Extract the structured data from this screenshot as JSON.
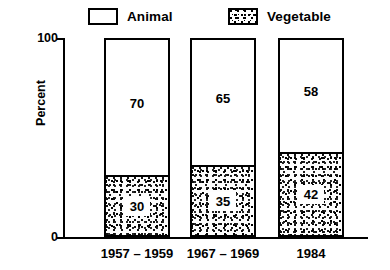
{
  "chart_data": {
    "type": "bar",
    "subtype": "stacked-bar",
    "title": "",
    "xlabel": "",
    "ylabel": "Percent",
    "ylim": [
      0,
      100
    ],
    "ytick_labels": [
      "0",
      "100"
    ],
    "grid": false,
    "legend_position": "top",
    "categories": [
      "1957 – 1959",
      "1967 – 1969",
      "1984"
    ],
    "series": [
      {
        "name": "Animal",
        "values": [
          70,
          65,
          58
        ],
        "fill": "white",
        "swatch": "empty-box"
      },
      {
        "name": "Vegetable",
        "values": [
          30,
          35,
          42
        ],
        "fill": "stipple",
        "swatch": "stippled-box"
      }
    ],
    "bars": [
      {
        "category": "1957 – 1959",
        "segments": [
          {
            "series": "Animal",
            "value": 70,
            "label": "70"
          },
          {
            "series": "Vegetable",
            "value": 30,
            "label": "30"
          }
        ]
      },
      {
        "category": "1967 – 1969",
        "segments": [
          {
            "series": "Animal",
            "value": 65,
            "label": "65"
          },
          {
            "series": "Vegetable",
            "value": 35,
            "label": "35"
          }
        ]
      },
      {
        "category": "1984",
        "segments": [
          {
            "series": "Animal",
            "value": 58,
            "label": "58"
          },
          {
            "series": "Vegetable",
            "value": 42,
            "label": "42"
          }
        ]
      }
    ],
    "colors": {
      "axis": "#000000",
      "outline": "#000000",
      "animal_fill": "#ffffff",
      "vegetable_fill": "#000000",
      "background": "#ffffff"
    }
  },
  "legend": {
    "items": [
      {
        "label": "Animal",
        "swatch": "empty-box"
      },
      {
        "label": "Vegetable",
        "swatch": "stippled-box"
      }
    ]
  },
  "axes": {
    "y_title": "Percent",
    "y_top_tick": "100",
    "y_bottom_tick": "0"
  }
}
